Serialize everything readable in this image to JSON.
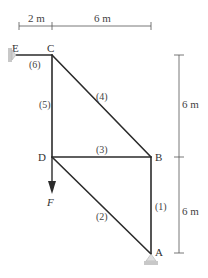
{
  "diagram": {
    "type": "truss",
    "colors": {
      "member": "#2b2b2b",
      "dimension": "#555555",
      "support": "#b8b8b8",
      "label": "#333333"
    },
    "nodes": {
      "A": {
        "label": "A"
      },
      "B": {
        "label": "B"
      },
      "C": {
        "label": "C"
      },
      "D": {
        "label": "D"
      },
      "E": {
        "label": "E"
      }
    },
    "members": [
      {
        "id": "1",
        "label": "(1)",
        "from": "A",
        "to": "B"
      },
      {
        "id": "2",
        "label": "(2)",
        "from": "D",
        "to": "A"
      },
      {
        "id": "3",
        "label": "(3)",
        "from": "D",
        "to": "B"
      },
      {
        "id": "4",
        "label": "(4)",
        "from": "C",
        "to": "B"
      },
      {
        "id": "5",
        "label": "(5)",
        "from": "C",
        "to": "D"
      },
      {
        "id": "6",
        "label": "(6)",
        "from": "E",
        "to": "C"
      }
    ],
    "load": {
      "label": "F",
      "node": "D",
      "direction": "down"
    },
    "supports": [
      {
        "node": "E",
        "type": "pin",
        "side": "left"
      },
      {
        "node": "A",
        "type": "pin",
        "side": "bottom"
      }
    ],
    "dimensions": {
      "horizontal": [
        {
          "label": "2 m",
          "span": "E-C"
        },
        {
          "label": "6 m",
          "span": "C-B"
        }
      ],
      "vertical": [
        {
          "label": "6 m",
          "span": "C-B level"
        },
        {
          "label": "6 m",
          "span": "B-A level"
        }
      ]
    }
  }
}
